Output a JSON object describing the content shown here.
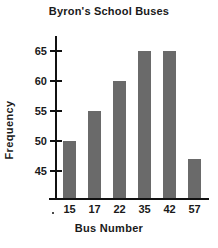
{
  "chart_data": {
    "type": "bar",
    "title": "Byron's School Buses",
    "xlabel": "Bus Number",
    "ylabel": "Frequency",
    "categories": [
      "15",
      "17",
      "22",
      "35",
      "42",
      "57"
    ],
    "values": [
      50,
      55,
      60,
      65,
      65,
      47
    ],
    "ytick_labels": [
      "45",
      "50",
      "55",
      "60",
      "65"
    ],
    "ytick_values": [
      45,
      50,
      55,
      60,
      65
    ],
    "ylim": [
      40.5,
      67.5
    ],
    "grid": false,
    "legend": null,
    "bar_color": "#6a6a6a",
    "axis_color": "#111111",
    "background": "#ffffff"
  },
  "marks": {
    "origin_dot": "origin-dot-mark"
  }
}
